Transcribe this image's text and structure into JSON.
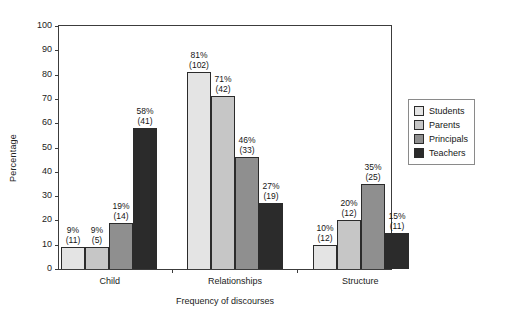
{
  "chart_data": {
    "type": "bar",
    "title": "",
    "xlabel": "Frequency of discourses",
    "ylabel": "Percentage",
    "ylim": [
      0,
      100
    ],
    "ytick_step": 10,
    "yticks": [
      0,
      10,
      20,
      30,
      40,
      50,
      60,
      70,
      80,
      90,
      100
    ],
    "grid": false,
    "legend_position": "right",
    "categories": [
      "Child",
      "Relationships",
      "Structure"
    ],
    "series": [
      {
        "name": "Students",
        "color": "#e4e4e4",
        "values": [
          9,
          81,
          10
        ],
        "counts": [
          11,
          102,
          12
        ],
        "labels": [
          "9%",
          "81%",
          "10%"
        ],
        "count_labels": [
          "(11)",
          "(102)",
          "(12)"
        ]
      },
      {
        "name": "Parents",
        "color": "#c6c6c6",
        "values": [
          9,
          71,
          20
        ],
        "counts": [
          5,
          42,
          12
        ],
        "labels": [
          "9%",
          "71%",
          "20%"
        ],
        "count_labels": [
          "(5)",
          "(42)",
          "(12)"
        ]
      },
      {
        "name": "Principals",
        "color": "#8f8f8f",
        "values": [
          19,
          46,
          35
        ],
        "counts": [
          14,
          33,
          25
        ],
        "labels": [
          "19%",
          "46%",
          "35%"
        ],
        "count_labels": [
          "(14)",
          "(33)",
          "(25)"
        ]
      },
      {
        "name": "Teachers",
        "color": "#2b2b2b",
        "values": [
          58,
          27,
          15
        ],
        "counts": [
          41,
          19,
          11
        ],
        "labels": [
          "58%",
          "27%",
          "15%"
        ],
        "count_labels": [
          "(41)",
          "(19)",
          "(11)"
        ]
      }
    ]
  },
  "axis": {
    "y_label": "Percentage",
    "x_label": "Frequency of discourses",
    "y_tick_labels": [
      "0",
      "10",
      "20",
      "30",
      "40",
      "50",
      "60",
      "70",
      "80",
      "90",
      "100"
    ],
    "x_tick_labels": [
      "Child",
      "Relationships",
      "Structure"
    ]
  },
  "legend": {
    "items": [
      {
        "label": "Students",
        "color": "#e4e4e4"
      },
      {
        "label": "Parents",
        "color": "#c6c6c6"
      },
      {
        "label": "Principals",
        "color": "#8f8f8f"
      },
      {
        "label": "Teachers",
        "color": "#2b2b2b"
      }
    ]
  }
}
